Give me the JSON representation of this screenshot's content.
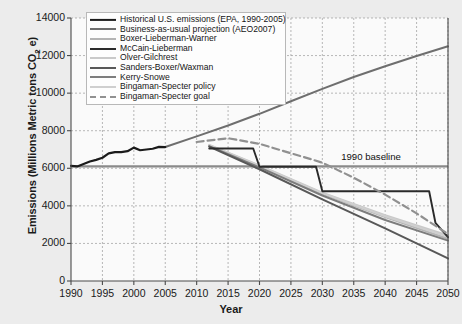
{
  "chart_data": {
    "type": "line",
    "title": "",
    "xlabel": "Year",
    "ylabel": "Emissions (Millions Metric tons CO2 e)",
    "ylabel_parts": {
      "pre": "Emissions (Millions Metric tons CO",
      "sub": "2",
      "post": " e)"
    },
    "xlim": [
      1990,
      2050
    ],
    "ylim": [
      0,
      14000
    ],
    "xticks": [
      1990,
      1995,
      2000,
      2005,
      2010,
      2015,
      2020,
      2025,
      2030,
      2035,
      2040,
      2045,
      2050
    ],
    "yticks": [
      0,
      2000,
      4000,
      6000,
      8000,
      10000,
      12000,
      14000
    ],
    "grid": true,
    "grid_style": "dashed",
    "legend_position": "top-left-inside",
    "annotations": [
      {
        "text": "1990 baseline",
        "x": 2033,
        "y": 6100,
        "line_y": 6100,
        "line_x0": 1990,
        "line_x1": 2050,
        "color": "#8a8a8a"
      }
    ],
    "series": [
      {
        "name": "Historical U.S. emissions (EPA, 1990-2005)",
        "color": "#1b1b1b",
        "width": 2.2,
        "dash": "solid",
        "points": [
          [
            1990,
            6130
          ],
          [
            1991,
            6100
          ],
          [
            1992,
            6230
          ],
          [
            1993,
            6360
          ],
          [
            1994,
            6450
          ],
          [
            1995,
            6560
          ],
          [
            1996,
            6790
          ],
          [
            1997,
            6860
          ],
          [
            1998,
            6860
          ],
          [
            1999,
            6910
          ],
          [
            2000,
            7100
          ],
          [
            2001,
            6960
          ],
          [
            2002,
            7000
          ],
          [
            2003,
            7040
          ],
          [
            2004,
            7140
          ],
          [
            2005,
            7130
          ]
        ]
      },
      {
        "name": "Business-as-usual projection (AEO2007)",
        "color": "#6e6e6e",
        "width": 2.0,
        "dash": "solid",
        "points": [
          [
            2005,
            7130
          ],
          [
            2010,
            7700
          ],
          [
            2015,
            8280
          ],
          [
            2020,
            8900
          ],
          [
            2025,
            9570
          ],
          [
            2030,
            10230
          ],
          [
            2035,
            10860
          ],
          [
            2040,
            11430
          ],
          [
            2045,
            11980
          ],
          [
            2050,
            12500
          ]
        ]
      },
      {
        "name": "Boxer-Lieberman-Warner",
        "color": "#b4b4b4",
        "width": 2.0,
        "dash": "solid",
        "points": [
          [
            2012,
            7200
          ],
          [
            2020,
            6100
          ],
          [
            2030,
            4650
          ],
          [
            2040,
            3400
          ],
          [
            2050,
            2250
          ]
        ]
      },
      {
        "name": "McCain-Lieberman",
        "color": "#2a2a2a",
        "width": 1.9,
        "dash": "solid",
        "points": [
          [
            2012,
            7050
          ],
          [
            2019,
            7050
          ],
          [
            2020,
            6080
          ],
          [
            2029,
            6080
          ],
          [
            2030,
            4780
          ],
          [
            2047,
            4780
          ],
          [
            2048,
            3100
          ],
          [
            2050,
            2330
          ]
        ]
      },
      {
        "name": "Olver-Gilchrest",
        "color": "#c9c9c9",
        "width": 2.0,
        "dash": "solid",
        "points": [
          [
            2012,
            7250
          ],
          [
            2020,
            6150
          ],
          [
            2030,
            4700
          ],
          [
            2040,
            3500
          ],
          [
            2050,
            2420
          ]
        ]
      },
      {
        "name": "Sanders-Boxer/Waxman",
        "color": "#585858",
        "width": 2.0,
        "dash": "solid",
        "points": [
          [
            2012,
            7150
          ],
          [
            2020,
            5950
          ],
          [
            2030,
            4350
          ],
          [
            2040,
            2800
          ],
          [
            2050,
            1200
          ]
        ]
      },
      {
        "name": "Kerry-Snowe",
        "color": "#7d7d7d",
        "width": 2.0,
        "dash": "solid",
        "points": [
          [
            2012,
            7180
          ],
          [
            2020,
            6050
          ],
          [
            2030,
            4550
          ],
          [
            2040,
            3250
          ],
          [
            2050,
            2150
          ]
        ]
      },
      {
        "name": "Bingaman-Specter policy",
        "color": "#cfcfcf",
        "width": 2.0,
        "dash": "solid",
        "points": [
          [
            2012,
            7230
          ],
          [
            2020,
            6120
          ],
          [
            2030,
            4680
          ],
          [
            2040,
            3450
          ],
          [
            2050,
            2350
          ]
        ]
      },
      {
        "name": "Bingaman-Specter goal",
        "color": "#909090",
        "width": 2.2,
        "dash": "dashed",
        "points": [
          [
            2010,
            7400
          ],
          [
            2015,
            7600
          ],
          [
            2020,
            7300
          ],
          [
            2025,
            6800
          ],
          [
            2030,
            6300
          ],
          [
            2035,
            5500
          ],
          [
            2040,
            4600
          ],
          [
            2045,
            3600
          ],
          [
            2050,
            2500
          ]
        ]
      }
    ]
  }
}
